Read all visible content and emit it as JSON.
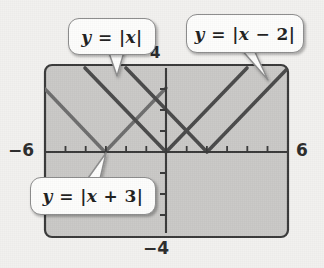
{
  "figure": {
    "type": "math-graph"
  },
  "axes": {
    "x_min_label": "−6",
    "x_max_label": "6",
    "y_max_label": "4",
    "y_min_label": "−4",
    "x_range": [
      -6,
      6
    ],
    "y_range": [
      -4,
      4
    ],
    "tick_interval": 1,
    "grid": false
  },
  "callouts": [
    {
      "id": "c1",
      "label_html": "y = |x|",
      "y": "y",
      "eq": "= |x|",
      "points_to": [
        -1.6,
        1.6
      ]
    },
    {
      "id": "c2",
      "label_html": "y = |x − 2|",
      "y": "y",
      "eq": "= |x − 2|",
      "points_to": [
        5.2,
        2.6
      ]
    },
    {
      "id": "c3",
      "label_html": "y = |x + 3|",
      "y": "y",
      "eq": "= |x + 3|",
      "points_to": [
        -3,
        0
      ]
    }
  ],
  "chart_data": {
    "type": "line",
    "title": "",
    "xlabel": "",
    "ylabel": "",
    "xlim": [
      -6,
      6
    ],
    "ylim": [
      -4,
      4
    ],
    "grid": false,
    "legend": "callout-bubbles",
    "series": [
      {
        "name": "y = |x|",
        "expression": "y = |x|",
        "vertex": [
          0,
          0
        ],
        "color": "#4a4a4a",
        "x": [
          -4,
          0,
          4
        ],
        "values": [
          4,
          0,
          4
        ]
      },
      {
        "name": "y = |x - 2|",
        "expression": "y = |x − 2|",
        "vertex": [
          2,
          0
        ],
        "color": "#4a4a4a",
        "x": [
          -2,
          2,
          6
        ],
        "values": [
          4,
          0,
          4
        ]
      },
      {
        "name": "y = |x + 3|",
        "expression": "y = |x + 3|",
        "vertex": [
          -3,
          0
        ],
        "color": "#6d6d6d",
        "x": [
          -6,
          -3,
          1
        ],
        "values": [
          3,
          0,
          4
        ]
      }
    ]
  },
  "colors": {
    "plot_fill": "#c9c8c6",
    "plot_border": "#3a3a3a",
    "axis": "#3a3a3a",
    "line_dark": "#4a4a4a",
    "line_mid": "#6d6d6d",
    "callout_bg": "#fdfdfc",
    "callout_border": "#8d8d8d",
    "text": "#2c2c2c",
    "page_bg": "#f2f1ef"
  }
}
